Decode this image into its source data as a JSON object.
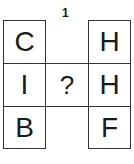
{
  "puzzle": {
    "number": "1",
    "grid": {
      "left_column": [
        "C",
        "I",
        "B"
      ],
      "middle_column": [
        "",
        "?",
        ""
      ],
      "right_column": [
        "H",
        "H",
        "F"
      ]
    }
  }
}
